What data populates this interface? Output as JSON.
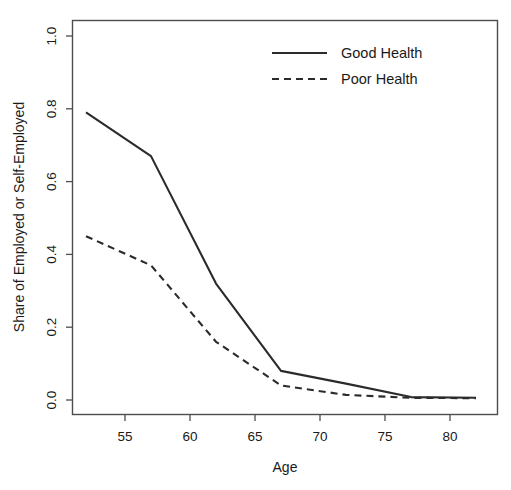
{
  "chart_data": {
    "type": "line",
    "title": "",
    "xlabel": "Age",
    "ylabel": "Share of Employed or Self-Employed",
    "xlim": [
      51.0,
      83.0
    ],
    "ylim": [
      0.0,
      1.04
    ],
    "xticks": [
      55,
      60,
      65,
      70,
      75,
      80
    ],
    "xtick_labels": [
      "55",
      "60",
      "65",
      "70",
      "75",
      "80"
    ],
    "yticks": [
      0.0,
      0.2,
      0.4,
      0.6,
      0.8,
      1.0
    ],
    "ytick_labels": [
      "0.0",
      "0.2",
      "0.4",
      "0.6",
      "0.8",
      "1.0"
    ],
    "grid": false,
    "legend_position": "top-right",
    "x": [
      52,
      57,
      62,
      67,
      72,
      77,
      82
    ],
    "series": [
      {
        "name": "Good Health",
        "style": "solid",
        "color": "#2b2b2b",
        "values": [
          0.79,
          0.67,
          0.32,
          0.08,
          0.045,
          0.008,
          0.006
        ]
      },
      {
        "name": "Poor Health",
        "style": "dashed",
        "color": "#2b2b2b",
        "values": [
          0.45,
          0.37,
          0.16,
          0.04,
          0.014,
          0.006,
          0.005
        ]
      }
    ]
  },
  "legend": {
    "entries": [
      {
        "label": "Good Health",
        "style": "solid"
      },
      {
        "label": "Poor Health",
        "style": "dashed"
      }
    ]
  },
  "axes": {
    "x_title": "Age",
    "y_title": "Share of Employed or Self-Employed"
  }
}
